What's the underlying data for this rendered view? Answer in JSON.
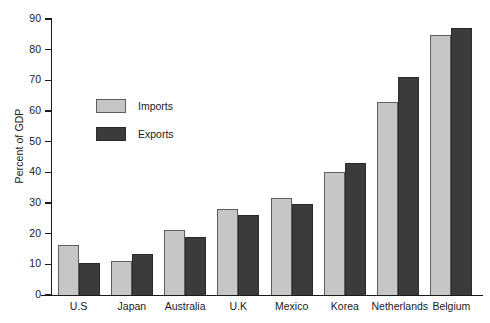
{
  "chart_data": {
    "type": "bar",
    "title": "",
    "subtitle": "",
    "xlabel": "",
    "ylabel": "Percent of GDP",
    "ylim": [
      0,
      90
    ],
    "ytick_step": 10,
    "yticks": [
      0,
      10,
      20,
      30,
      40,
      50,
      60,
      70,
      80,
      90
    ],
    "ytick_labels": [
      "0",
      "10",
      "20",
      "30",
      "40",
      "50",
      "60",
      "70",
      "80",
      "90"
    ],
    "grid": false,
    "legend_position": "upper-left-inside",
    "categories": [
      "U.S",
      "Japan",
      "Australia",
      "U.K",
      "Mexico",
      "Korea",
      "Netherlands",
      "Belgium"
    ],
    "series": [
      {
        "name": "Imports",
        "color": "#c6c6c6",
        "values": [
          16.2,
          11.2,
          21.3,
          28.1,
          31.5,
          40.1,
          63.0,
          84.8
        ]
      },
      {
        "name": "Exports",
        "color": "#3b3b3b",
        "values": [
          10.3,
          13.3,
          19.0,
          26.0,
          29.8,
          42.9,
          71.0,
          87.0
        ]
      }
    ]
  },
  "colors": {
    "imports": "#c6c6c6",
    "exports": "#3b3b3b",
    "axis": "#1a1a1a",
    "background": "#ffffff"
  }
}
